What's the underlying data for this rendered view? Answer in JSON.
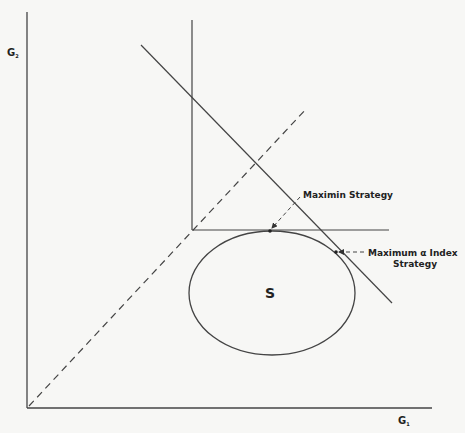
{
  "diagram": {
    "type": "game-theory-strategy-diagram",
    "axes": {
      "x_label": "G",
      "x_subscript": "1",
      "y_label": "G",
      "y_subscript": "2"
    },
    "region": {
      "label": "S"
    },
    "annotations": {
      "maximin": "Maximin Strategy",
      "alpha_index_line1": "Maximum α Index",
      "alpha_index_line2": "Strategy"
    },
    "elements": [
      {
        "name": "x-axis",
        "kind": "line"
      },
      {
        "name": "y-axis",
        "kind": "line"
      },
      {
        "name": "45-degree-line",
        "kind": "dashed-line"
      },
      {
        "name": "maximin-L-vertical",
        "kind": "line"
      },
      {
        "name": "maximin-L-horizontal",
        "kind": "line"
      },
      {
        "name": "alpha-index-line",
        "kind": "line"
      },
      {
        "name": "strategy-set-S",
        "kind": "ellipse"
      },
      {
        "name": "maximin-point",
        "kind": "point"
      },
      {
        "name": "alpha-index-point",
        "kind": "point"
      }
    ],
    "colors": {
      "stroke": "#333333",
      "background": "#f7f7f5"
    }
  }
}
